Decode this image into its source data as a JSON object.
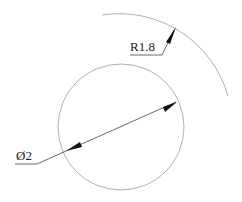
{
  "drawing": {
    "circle": {
      "cx": 121,
      "cy": 127,
      "r": 63,
      "label": "Ø2"
    },
    "arc": {
      "cx": 121,
      "cy": 127,
      "r": 113,
      "label": "R1.8"
    },
    "colors": {
      "geometry": "#9a9a9a",
      "dimension": "#444444",
      "arrow": "#111111",
      "text": "#222222"
    }
  }
}
